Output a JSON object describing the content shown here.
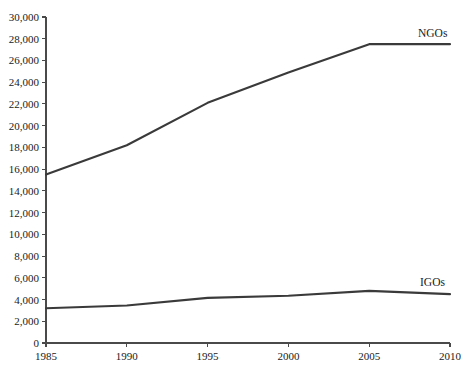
{
  "chart_data": {
    "type": "line",
    "title": "",
    "subtitle": "",
    "xlabel": "",
    "ylabel": "",
    "x": [
      1985,
      1990,
      1995,
      2000,
      2005,
      2010
    ],
    "xlim": [
      1985,
      2010
    ],
    "ylim": [
      0,
      30000
    ],
    "grid": false,
    "legend_position": "inline-right",
    "xtick_labels": [
      "1985",
      "1990",
      "1995",
      "2000",
      "2005",
      "2010"
    ],
    "ytick_values": [
      0,
      2000,
      4000,
      6000,
      8000,
      10000,
      12000,
      14000,
      16000,
      18000,
      20000,
      22000,
      24000,
      26000,
      28000,
      30000
    ],
    "ytick_labels": [
      "0",
      "2,000",
      "4,000",
      "6,000",
      "8,000",
      "10,000",
      "12,000",
      "14,000",
      "16,000",
      "18,000",
      "20,000",
      "22,000",
      "24,000",
      "26,000",
      "28,000",
      "30,000"
    ],
    "series": [
      {
        "name": "NGOs",
        "label": "NGOs",
        "color": "#3a3a3a",
        "values": [
          15500,
          18200,
          22100,
          24900,
          27500,
          27500
        ]
      },
      {
        "name": "IGOs",
        "label": "IGOs",
        "color": "#3a3a3a",
        "values": [
          3200,
          3450,
          4150,
          4350,
          4800,
          4500
        ]
      }
    ],
    "axis_color": "#4a4a4a",
    "background": "#ffffff"
  },
  "geometry": {
    "plot_left": 46,
    "plot_right": 450,
    "plot_top": 17,
    "plot_bottom": 343
  }
}
